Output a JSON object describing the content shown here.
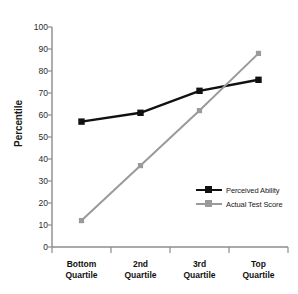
{
  "chart_data": {
    "type": "line",
    "title": "",
    "subtitle": "",
    "xlabel": "",
    "ylabel": "Percentile",
    "ylim": [
      0,
      100
    ],
    "yticks": [
      0,
      10,
      20,
      30,
      40,
      50,
      60,
      70,
      80,
      90,
      100
    ],
    "grid": false,
    "legend_position": "inside-lower-right",
    "categories": [
      "Bottom Quartile",
      "2nd Quartile",
      "3rd Quartile",
      "Top Quartile"
    ],
    "category_lines": [
      [
        "Bottom",
        "Quartile"
      ],
      [
        "2nd",
        "Quartile"
      ],
      [
        "3rd",
        "Quartile"
      ],
      [
        "Top",
        "Quartile"
      ]
    ],
    "series": [
      {
        "name": "Perceived Ability",
        "color": "#111111",
        "marker": "square",
        "values": [
          57,
          61,
          71,
          76
        ]
      },
      {
        "name": "Actual Test Score",
        "color": "#9a9a9a",
        "marker": "square",
        "values": [
          12,
          37,
          62,
          88
        ]
      }
    ]
  },
  "axis": {
    "y_label": "Percentile",
    "y_tick_labels": [
      "100",
      "90",
      "80",
      "70",
      "60",
      "50",
      "40",
      "30",
      "20",
      "10",
      "0"
    ],
    "axis_color": "#8c8c8c"
  },
  "legend": {
    "items": [
      {
        "label": "Perceived Ability",
        "color": "#111111"
      },
      {
        "label": "Actual Test Score",
        "color": "#9a9a9a"
      }
    ]
  },
  "colors": {
    "background": "#ffffff",
    "perceived": "#111111",
    "actual": "#9a9a9a",
    "axis": "#8c8c8c",
    "text": "#1a1a1a"
  }
}
